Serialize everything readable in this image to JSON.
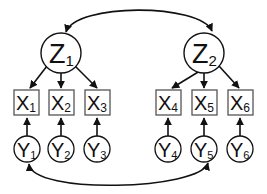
{
  "diagram": {
    "latent_factors": [
      {
        "id": "Z1",
        "base": "Z",
        "sub": "1"
      },
      {
        "id": "Z2",
        "base": "Z",
        "sub": "2"
      }
    ],
    "indicators": [
      {
        "id": "X1",
        "base": "X",
        "sub": "1"
      },
      {
        "id": "X2",
        "base": "X",
        "sub": "2"
      },
      {
        "id": "X3",
        "base": "X",
        "sub": "3"
      },
      {
        "id": "X4",
        "base": "X",
        "sub": "4"
      },
      {
        "id": "X5",
        "base": "X",
        "sub": "5"
      },
      {
        "id": "X6",
        "base": "X",
        "sub": "6"
      }
    ],
    "errors": [
      {
        "id": "Y1",
        "base": "Y",
        "sub": "1"
      },
      {
        "id": "Y2",
        "base": "Y",
        "sub": "2"
      },
      {
        "id": "Y3",
        "base": "Y",
        "sub": "3"
      },
      {
        "id": "Y4",
        "base": "Y",
        "sub": "4"
      },
      {
        "id": "Y5",
        "base": "Y",
        "sub": "5"
      },
      {
        "id": "Y6",
        "base": "Y",
        "sub": "6"
      }
    ],
    "edges": [
      {
        "from": "Z1",
        "to": "Z2",
        "type": "bidirectional-curve"
      },
      {
        "from": "Z1",
        "to": "X1",
        "type": "directed"
      },
      {
        "from": "Z1",
        "to": "X2",
        "type": "directed"
      },
      {
        "from": "Z1",
        "to": "X3",
        "type": "directed"
      },
      {
        "from": "Z2",
        "to": "X4",
        "type": "directed"
      },
      {
        "from": "Z2",
        "to": "X5",
        "type": "directed"
      },
      {
        "from": "Z2",
        "to": "X6",
        "type": "directed"
      },
      {
        "from": "Y1",
        "to": "X1",
        "type": "directed"
      },
      {
        "from": "Y2",
        "to": "X2",
        "type": "directed"
      },
      {
        "from": "Y3",
        "to": "X3",
        "type": "directed"
      },
      {
        "from": "Y4",
        "to": "X4",
        "type": "directed"
      },
      {
        "from": "Y5",
        "to": "X5",
        "type": "directed"
      },
      {
        "from": "Y6",
        "to": "X6",
        "type": "directed"
      },
      {
        "from": "Y1",
        "to": "Y5",
        "type": "bidirectional-curve"
      }
    ]
  }
}
